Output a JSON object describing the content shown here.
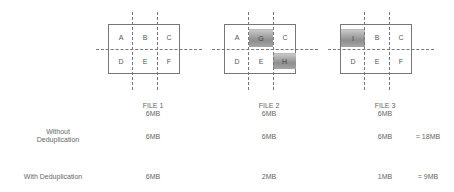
{
  "files": [
    {
      "name": "FILE 1",
      "size": "6MB",
      "blocks": [
        {
          "label": "A",
          "changed": false
        },
        {
          "label": "B",
          "changed": false
        },
        {
          "label": "C",
          "changed": false
        },
        {
          "label": "D",
          "changed": false
        },
        {
          "label": "E",
          "changed": false
        },
        {
          "label": "F",
          "changed": false
        }
      ]
    },
    {
      "name": "FILE 2",
      "size": "6MB",
      "blocks": [
        {
          "label": "A",
          "changed": false
        },
        {
          "label": "G",
          "changed": true
        },
        {
          "label": "C",
          "changed": false
        },
        {
          "label": "D",
          "changed": false
        },
        {
          "label": "E",
          "changed": false
        },
        {
          "label": "H",
          "changed": true
        }
      ]
    },
    {
      "name": "FILE 3",
      "size": "6MB",
      "blocks": [
        {
          "label": "I",
          "changed": true
        },
        {
          "label": "B",
          "changed": false
        },
        {
          "label": "C",
          "changed": false
        },
        {
          "label": "D",
          "changed": false
        },
        {
          "label": "E",
          "changed": false
        },
        {
          "label": "F",
          "changed": false
        }
      ]
    }
  ],
  "rows": {
    "without": {
      "label_line1": "Without",
      "label_line2": "Deduplication",
      "values": [
        "6MB",
        "6MB",
        "6MB"
      ],
      "total": "= 18MB"
    },
    "with": {
      "label": "With Deduplication",
      "values": [
        "6MB",
        "2MB",
        "1MB"
      ],
      "total": "= 9MB"
    }
  }
}
